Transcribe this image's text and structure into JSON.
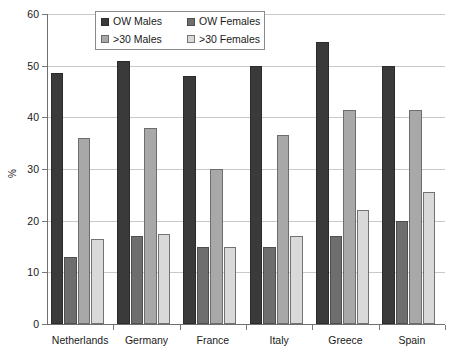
{
  "chart_data": {
    "type": "bar",
    "title": "",
    "xlabel": "",
    "ylabel": "%",
    "ylim": [
      0,
      60
    ],
    "ytick_step": 10,
    "yticks": [
      0,
      10,
      20,
      30,
      40,
      50,
      60
    ],
    "grid": true,
    "legend_position": "top-center",
    "categories": [
      "Netherlands",
      "Germany",
      "France",
      "Italy",
      "Greece",
      "Spain"
    ],
    "series": [
      {
        "name": "OW Males",
        "color": "#3a3a3a",
        "values": [
          48.5,
          51.0,
          48.0,
          50.0,
          54.5,
          50.0
        ]
      },
      {
        "name": "OW Females",
        "color": "#6e6e6e",
        "values": [
          13.0,
          17.0,
          15.0,
          15.0,
          17.0,
          20.0
        ]
      },
      {
        "name": ">30 Males",
        "color": "#a8a8a8",
        "values": [
          36.0,
          38.0,
          30.0,
          36.5,
          41.5,
          41.5
        ]
      },
      {
        "name": ">30 Females",
        "color": "#d9d9d9",
        "values": [
          16.5,
          17.5,
          15.0,
          17.0,
          22.0,
          25.5
        ]
      }
    ]
  }
}
